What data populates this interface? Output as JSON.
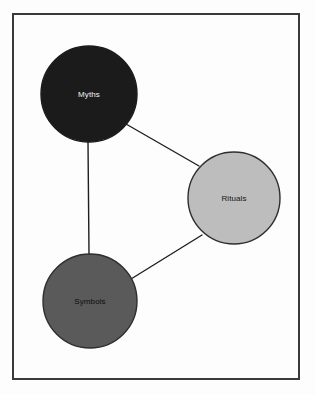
{
  "figure": {
    "background_color": "#fdfdfd",
    "frame": {
      "border_color": "#3a3a3c",
      "border_width": 2,
      "fill_color": "#fdfdfd"
    }
  },
  "chart_data": {
    "type": "diagram",
    "subtype": "node-link-graph",
    "title": "",
    "nodes": [
      {
        "id": "myths",
        "label": "Myths",
        "cx": 89,
        "cy": 94,
        "r": 48,
        "fill": "#1c1b1b",
        "stroke": "#1c1b1b",
        "text_color": "#f2f2f2"
      },
      {
        "id": "rituals",
        "label": "Rituals",
        "cx": 234,
        "cy": 198,
        "r": 46,
        "fill": "#bdbdbd",
        "stroke": "#2e2e2e",
        "text_color": "#141414"
      },
      {
        "id": "symbols",
        "label": "Symbols",
        "cx": 90,
        "cy": 301,
        "r": 47,
        "fill": "#5a5a5a",
        "stroke": "#2e2e2e",
        "text_color": "#0d0d0d"
      }
    ],
    "edges": [
      {
        "id": "edge-myths-rituals",
        "source": "myths",
        "target": "rituals",
        "x1": 126,
        "y1": 124,
        "x2": 199,
        "y2": 166,
        "stroke": "#1f1f1f",
        "stroke_width": 1.4
      },
      {
        "id": "edge-myths-symbols",
        "source": "myths",
        "target": "symbols",
        "x1": 88,
        "y1": 142,
        "x2": 89,
        "y2": 254,
        "stroke": "#1f1f1f",
        "stroke_width": 1.4
      },
      {
        "id": "edge-symbols-rituals",
        "source": "symbols",
        "target": "rituals",
        "x1": 131,
        "y1": 279,
        "x2": 202,
        "y2": 235,
        "stroke": "#1f1f1f",
        "stroke_width": 1.4
      }
    ],
    "legend": null,
    "annotations": []
  }
}
